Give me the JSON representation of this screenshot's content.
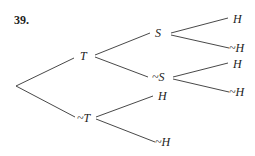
{
  "problem": {
    "number": "39."
  },
  "tree": {
    "root": {
      "x": 16,
      "y": 86
    },
    "nodes": [
      {
        "id": "T",
        "label": "T",
        "x": 84,
        "y": 60
      },
      {
        "id": "notT",
        "label": "~T",
        "x": 78,
        "y": 122
      },
      {
        "id": "S",
        "label": "S",
        "x": 155,
        "y": 37
      },
      {
        "id": "notS",
        "label": "~S",
        "x": 151,
        "y": 81
      },
      {
        "id": "T_S_H",
        "label": "H",
        "x": 233,
        "y": 23
      },
      {
        "id": "T_S_notH",
        "label": "~H",
        "x": 228,
        "y": 52
      },
      {
        "id": "T_notS_H",
        "label": "H",
        "x": 233,
        "y": 68
      },
      {
        "id": "T_notS_notH",
        "label": "~H",
        "x": 228,
        "y": 96
      },
      {
        "id": "notT_H",
        "label": "H",
        "x": 159,
        "y": 100
      },
      {
        "id": "notT_notH",
        "label": "~H",
        "x": 154,
        "y": 146
      }
    ],
    "edges": [
      {
        "from": "root",
        "to": "T"
      },
      {
        "from": "root",
        "to": "notT"
      },
      {
        "from": "T",
        "to": "S"
      },
      {
        "from": "T",
        "to": "notS"
      },
      {
        "from": "S",
        "to": "T_S_H"
      },
      {
        "from": "S",
        "to": "T_S_notH"
      },
      {
        "from": "notS",
        "to": "T_notS_H"
      },
      {
        "from": "notS",
        "to": "T_notS_notH"
      },
      {
        "from": "notT",
        "to": "notT_H"
      },
      {
        "from": "notT",
        "to": "notT_notH"
      }
    ]
  }
}
